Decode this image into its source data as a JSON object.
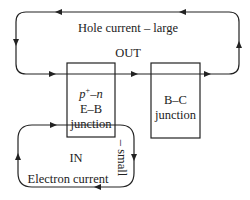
{
  "diagram": {
    "type": "transistor current flow",
    "outer_loop": {
      "label": "Hole current – large",
      "direction_label": "OUT"
    },
    "inner_loop": {
      "label": "Electron current",
      "side_label": "– small",
      "direction_label": "IN"
    },
    "eb_junction": {
      "line1_base": "p",
      "line1_sup": "+",
      "line1_rest": "–n",
      "line2": "E–B",
      "line3": "junction"
    },
    "bc_junction": {
      "line1": "B–C",
      "line2": "junction"
    },
    "colors": {
      "stroke": "#222222",
      "background": "#ffffff"
    }
  }
}
